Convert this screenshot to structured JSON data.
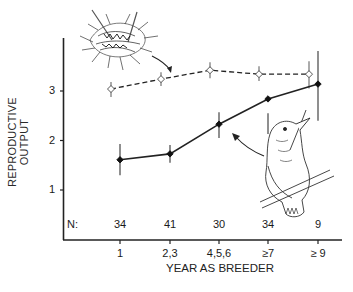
{
  "chart_data": {
    "type": "line",
    "title": "",
    "xlabel": "YEAR AS BREEDER",
    "ylabel": "REPRODUCTIVE OUTPUT",
    "categories": [
      "1",
      "2,3",
      "4,5,6",
      "≥7",
      "≥ 9"
    ],
    "n_label": "N:",
    "n_values": [
      "34",
      "41",
      "30",
      "34",
      "9"
    ],
    "y_ticks": [
      "1",
      "2",
      "3"
    ],
    "ylim": [
      0.0,
      3.8
    ],
    "grid": false,
    "legend": "none (series identified by illustrations: nest for dashed line, bird for solid line)",
    "series": [
      {
        "name": "nest (open diamonds, dashed line)",
        "style": "dashed",
        "marker": "open-diamond",
        "values": [
          3.04,
          3.24,
          3.42,
          3.34,
          3.34
        ],
        "error_low": [
          2.88,
          3.1,
          3.26,
          3.2,
          3.05
        ],
        "error_high": [
          3.18,
          3.38,
          3.58,
          3.5,
          3.6
        ]
      },
      {
        "name": "bird (filled diamonds, solid line)",
        "style": "solid",
        "marker": "filled-diamond",
        "values": [
          1.61,
          1.73,
          2.33,
          2.84,
          3.14
        ],
        "error_low": [
          1.3,
          1.55,
          2.05,
          2.55,
          2.4
        ],
        "error_high": [
          1.93,
          1.91,
          2.57,
          2.13,
          3.81
        ]
      }
    ]
  }
}
